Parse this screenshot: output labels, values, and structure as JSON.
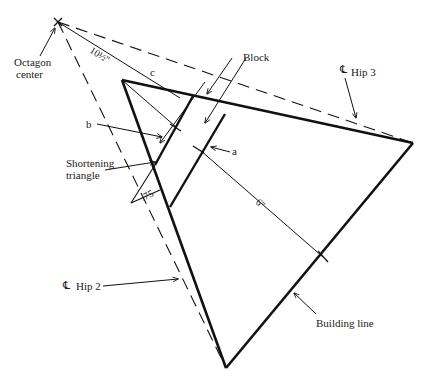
{
  "diagram": {
    "labels": {
      "octagon_center": [
        "Octagon",
        "center"
      ],
      "dim_10_5": "10½''",
      "c": "c",
      "block": "Block",
      "hip3_symbol": "℄",
      "hip3": "Hip 3",
      "b": "b",
      "a": "a",
      "shortening_triangle": [
        "Shortening",
        "triangle"
      ],
      "dim_075": ".75",
      "dim_6": "6''",
      "hip2_symbol": "℄",
      "hip2": "Hip 2",
      "building_line": "Building line"
    },
    "colors": {
      "stroke": "#111111",
      "background": "#ffffff"
    }
  }
}
